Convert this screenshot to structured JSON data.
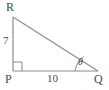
{
  "figure": {
    "type": "right-triangle-diagram",
    "stroke_color": "#8c8c8c",
    "text_color": "#4a4a4a",
    "background_color": "#ffffff",
    "vertices": [
      {
        "name": "R",
        "label": "R",
        "x": 13,
        "y": 17,
        "position": "top-left"
      },
      {
        "name": "P",
        "label": "P",
        "x": 13,
        "y": 71,
        "position": "bottom-left"
      },
      {
        "name": "Q",
        "label": "Q",
        "x": 98,
        "y": 71,
        "position": "bottom-right"
      }
    ],
    "sides": [
      {
        "name": "PR",
        "label": "7",
        "orientation": "vertical",
        "description": "left leg from P up to R"
      },
      {
        "name": "PQ",
        "label": "10",
        "orientation": "horizontal",
        "description": "bottom leg from P to Q"
      },
      {
        "name": "RQ",
        "label": "",
        "orientation": "hypotenuse",
        "description": "hypotenuse from R down to Q"
      }
    ],
    "angles": [
      {
        "name": "P",
        "label": "",
        "type": "right-angle",
        "marker": "square"
      },
      {
        "name": "Q",
        "label": "θ",
        "type": "acute",
        "marker": "arc"
      }
    ]
  }
}
